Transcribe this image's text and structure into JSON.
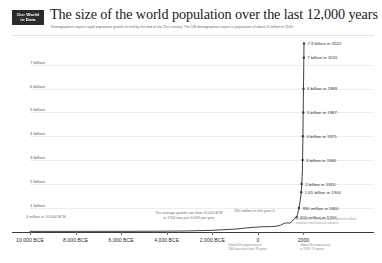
{
  "brand": {
    "line1": "Our World",
    "line2": "in Data"
  },
  "header": {
    "title": "The size of the world population over the last 12,000 years",
    "subtitle": "Demographers expect rapid population growth to end by the end of the 21st century. The UN demographers expect a population of about 11 billion in 2100."
  },
  "chart_data": {
    "type": "line",
    "title": "The size of the world population over the last 12,000 years",
    "xlabel": "",
    "ylabel": "",
    "xlim": [
      -10000,
      2022
    ],
    "ylim": [
      0,
      8000000000
    ],
    "grid": true,
    "legend": "none",
    "y_ticks": [
      {
        "value": 7000000000,
        "label": "7 billion"
      },
      {
        "value": 6000000000,
        "label": "6 billion"
      },
      {
        "value": 5000000000,
        "label": "5 billion"
      },
      {
        "value": 4000000000,
        "label": "4 billion"
      },
      {
        "value": 3000000000,
        "label": "3 billion"
      },
      {
        "value": 2000000000,
        "label": "2 billion"
      },
      {
        "value": 1000000000,
        "label": "1 billion"
      }
    ],
    "x_ticks": [
      {
        "value": -10000,
        "label": "10,000 BCE"
      },
      {
        "value": -8000,
        "label": "8,000 BCE"
      },
      {
        "value": -6000,
        "label": "6,000 BCE"
      },
      {
        "value": -4000,
        "label": "4,000 BCE"
      },
      {
        "value": -2000,
        "label": "2,000 BCE"
      },
      {
        "value": 0,
        "label": "0"
      },
      {
        "value": 2000,
        "label": "2000"
      }
    ],
    "x": [
      -10000,
      -8000,
      -6000,
      -5000,
      -4000,
      -3000,
      -2000,
      -1000,
      -500,
      0,
      200,
      400,
      600,
      800,
      1000,
      1100,
      1200,
      1300,
      1400,
      1500,
      1600,
      1700,
      1750,
      1800,
      1850,
      1900,
      1920,
      1940,
      1950,
      1960,
      1975,
      1987,
      1999,
      2011,
      2015,
      2022
    ],
    "values": [
      4000000,
      5000000,
      7000000,
      10000000,
      14000000,
      25000000,
      50000000,
      100000000,
      150000000,
      190000000,
      200000000,
      200000000,
      210000000,
      220000000,
      265000000,
      320000000,
      360000000,
      360000000,
      350000000,
      425000000,
      545000000,
      600000000,
      760000000,
      990000000,
      1260000000,
      1650000000,
      2000000000,
      2300000000,
      2500000000,
      3000000000,
      4000000000,
      5000000000,
      6000000000,
      7000000000,
      7300000000,
      7900000000
    ],
    "annotations": [
      {
        "label": "7.9 billion in 2022",
        "x": 2022,
        "y": 7900000000
      },
      {
        "label": "7 billion in 2015",
        "x": 2015,
        "y": 7300000000
      },
      {
        "label": "6 billion in 1999",
        "x": 1999,
        "y": 6000000000
      },
      {
        "label": "5 billion in 1987",
        "x": 1987,
        "y": 5000000000
      },
      {
        "label": "4 billion in 1975",
        "x": 1975,
        "y": 4000000000
      },
      {
        "label": "3 billion in 1960",
        "x": 1960,
        "y": 3000000000
      },
      {
        "label": "2 billion in 1920",
        "x": 1920,
        "y": 2000000000
      },
      {
        "label": "1.65 billion in 1900",
        "x": 1900,
        "y": 1650000000
      },
      {
        "label": "990 million in 1800",
        "x": 1800,
        "y": 990000000
      },
      {
        "label": "600 million in 1700",
        "x": 1700,
        "y": 600000000
      },
      {
        "label": "190 million in the year 0",
        "x": 0,
        "y": 190000000
      },
      {
        "label": "4 million in 10,000 BCE",
        "x": -10000,
        "y": 4000000
      }
    ]
  },
  "notes": {
    "growth_rate_line1": "The average growth rate from 10,000 BCE",
    "growth_rate_line2": "to 1700 was just 0.04% per year",
    "year_zero": "190 million in the year 0",
    "bce_start": "4 million in 10,000 BCE",
    "data_note_line1": "Data source: The World Bank, based on official",
    "data_note_line2": "estimates and historical research"
  },
  "footnotes": {
    "left_line1": "Global life expectancy in",
    "left_line2": "1800 was less than 30 years",
    "right_line1": "Global life expectancy",
    "right_line2": "in 2019: 73 years"
  },
  "colors": {
    "curve": "#2b2b2b",
    "grid": "#ededed",
    "axis": "#3b3b3b",
    "logo_bg": "#2b2b2b",
    "text": "#1d1d1d",
    "muted": "#6e6e6e"
  }
}
